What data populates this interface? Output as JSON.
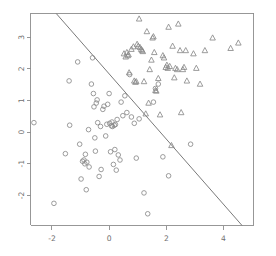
{
  "chart_data": {
    "type": "scatter",
    "title": "",
    "subtitle": "",
    "xlabel": "",
    "ylabel": "",
    "xlim": [
      -2.75,
      5.05
    ],
    "ylim": [
      -2.95,
      3.75
    ],
    "grid": false,
    "legend_position": "none",
    "xticks": [
      -2,
      0,
      2,
      4
    ],
    "xticklabels": [
      "-2",
      "0",
      "2",
      "4"
    ],
    "yticks": [
      3,
      2,
      1,
      0,
      -1,
      -2
    ],
    "yticklabels": [
      "3",
      "2",
      "1",
      "0",
      "-1",
      "-2"
    ],
    "ytick_label_rotation": -90,
    "annotations": [
      {
        "name": "decision-boundary",
        "type": "line",
        "x0": -1.85,
        "y0": 3.75,
        "x1": 4.65,
        "y1": -2.95,
        "color": "#7a7a7a"
      }
    ],
    "series": [
      {
        "name": "class-circle",
        "marker": "circle",
        "color": "#8a8a8a",
        "points": [
          [
            -2.63,
            0.3
          ],
          [
            -1.93,
            -2.25
          ],
          [
            -1.53,
            -0.68
          ],
          [
            -1.4,
            1.62
          ],
          [
            -1.38,
            0.22
          ],
          [
            -1.1,
            2.22
          ],
          [
            -1.03,
            -0.38
          ],
          [
            -0.98,
            -1.48
          ],
          [
            -0.93,
            -0.92
          ],
          [
            -0.88,
            -0.88
          ],
          [
            -0.85,
            -1.0
          ],
          [
            -0.83,
            -0.7
          ],
          [
            -0.8,
            -1.82
          ],
          [
            -0.78,
            -0.95
          ],
          [
            -0.72,
            0.08
          ],
          [
            -0.7,
            -1.1
          ],
          [
            -0.62,
            1.52
          ],
          [
            -0.58,
            2.35
          ],
          [
            -0.55,
            1.22
          ],
          [
            -0.53,
            0.8
          ],
          [
            -0.5,
            -0.18
          ],
          [
            -0.48,
            -0.6
          ],
          [
            -0.45,
            0.92
          ],
          [
            -0.42,
            1.02
          ],
          [
            -0.4,
            0.3
          ],
          [
            -0.35,
            -1.4
          ],
          [
            -0.3,
            0.18
          ],
          [
            -0.28,
            -1.18
          ],
          [
            -0.22,
            0.72
          ],
          [
            -0.18,
            0.82
          ],
          [
            -0.12,
            -0.12
          ],
          [
            -0.08,
            0.25
          ],
          [
            -0.05,
            0.88
          ],
          [
            0.0,
            1.22
          ],
          [
            0.02,
            0.28
          ],
          [
            0.05,
            -0.62
          ],
          [
            0.08,
            0.2
          ],
          [
            0.1,
            0.32
          ],
          [
            0.12,
            0.18
          ],
          [
            0.15,
            -1.02
          ],
          [
            0.18,
            0.22
          ],
          [
            0.2,
            -0.55
          ],
          [
            0.22,
            0.24
          ],
          [
            0.25,
            -1.2
          ],
          [
            0.28,
            0.4
          ],
          [
            0.32,
            -0.72
          ],
          [
            0.38,
            -0.88
          ],
          [
            0.42,
            0.95
          ],
          [
            0.48,
            0.52
          ],
          [
            0.55,
            1.15
          ],
          [
            0.62,
            0.62
          ],
          [
            0.72,
            1.82
          ],
          [
            0.78,
            0.48
          ],
          [
            0.88,
            0.28
          ],
          [
            0.95,
            -0.82
          ],
          [
            1.05,
            0.42
          ],
          [
            1.22,
            -1.92
          ],
          [
            1.35,
            -2.58
          ],
          [
            1.55,
            0.95
          ],
          [
            1.62,
            1.38
          ],
          [
            1.72,
            1.52
          ],
          [
            1.88,
            -0.78
          ],
          [
            2.08,
            -1.38
          ],
          [
            2.85,
            -0.38
          ]
        ]
      },
      {
        "name": "class-triangle",
        "marker": "triangle",
        "color": "#8a8a8a",
        "points": [
          [
            0.52,
            2.48
          ],
          [
            0.58,
            2.38
          ],
          [
            0.62,
            2.52
          ],
          [
            0.65,
            2.42
          ],
          [
            0.68,
            2.45
          ],
          [
            0.7,
            1.88
          ],
          [
            0.78,
            2.62
          ],
          [
            0.85,
            2.7
          ],
          [
            0.88,
            1.62
          ],
          [
            0.92,
            1.58
          ],
          [
            0.95,
            1.6
          ],
          [
            0.98,
            2.78
          ],
          [
            1.02,
            2.72
          ],
          [
            1.05,
            3.58
          ],
          [
            1.08,
            2.68
          ],
          [
            1.12,
            2.62
          ],
          [
            1.15,
            2.58
          ],
          [
            1.18,
            2.55
          ],
          [
            1.22,
            1.6
          ],
          [
            1.28,
            0.58
          ],
          [
            1.32,
            3.18
          ],
          [
            1.38,
            0.92
          ],
          [
            1.42,
            1.98
          ],
          [
            1.48,
            2.28
          ],
          [
            1.52,
            2.98
          ],
          [
            1.55,
            3.02
          ],
          [
            1.58,
            2.52
          ],
          [
            1.62,
            1.32
          ],
          [
            1.65,
            1.3
          ],
          [
            1.72,
            1.7
          ],
          [
            1.78,
            0.55
          ],
          [
            1.88,
            2.42
          ],
          [
            1.92,
            2.35
          ],
          [
            1.98,
            2.05
          ],
          [
            2.02,
            2.12
          ],
          [
            2.05,
            2.02
          ],
          [
            2.08,
            3.32
          ],
          [
            2.12,
            2.08
          ],
          [
            2.18,
            -0.42
          ],
          [
            2.22,
            2.72
          ],
          [
            2.28,
            1.72
          ],
          [
            2.32,
            2.02
          ],
          [
            2.38,
            1.98
          ],
          [
            2.42,
            3.42
          ],
          [
            2.48,
            2.58
          ],
          [
            2.52,
            0.62
          ],
          [
            2.58,
            1.98
          ],
          [
            2.62,
            2.05
          ],
          [
            2.68,
            2.58
          ],
          [
            2.72,
            1.62
          ],
          [
            2.95,
            2.48
          ],
          [
            3.05,
            2.02
          ],
          [
            3.18,
            1.52
          ],
          [
            3.35,
            2.58
          ],
          [
            3.62,
            2.98
          ],
          [
            4.25,
            2.65
          ],
          [
            4.52,
            2.82
          ]
        ]
      }
    ]
  }
}
